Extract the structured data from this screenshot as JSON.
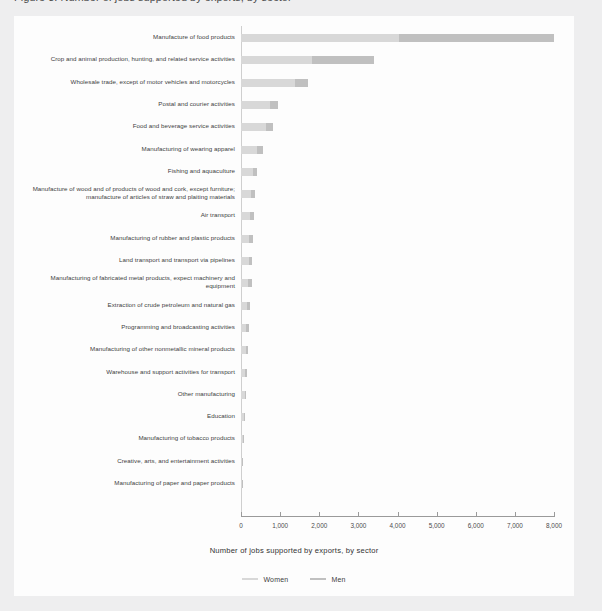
{
  "page": {
    "title_clipped": "Figure 3. Number of jobs supported by exports, by sector"
  },
  "chart_data": {
    "type": "bar",
    "orientation": "horizontal",
    "stacked": true,
    "title": "",
    "xlabel": "Number of jobs supported by exports, by sector",
    "ylabel": "",
    "xlim": [
      0,
      8000
    ],
    "xticks": [
      0,
      1000,
      2000,
      3000,
      4000,
      5000,
      6000,
      7000,
      8000
    ],
    "xticklabels": [
      "0",
      "1,000",
      "2,000",
      "3,000",
      "4,000",
      "5,000",
      "6,000",
      "7,000",
      "8,000"
    ],
    "grid": false,
    "legend_position": "bottom",
    "colors": {
      "women": "#d8d8d8",
      "men": "#c0c0c0"
    },
    "categories": [
      "Manufacture of food products",
      "Crop and animal production, hunting, and related service activities",
      "Wholesale trade, except of motor vehicles and motorcycles",
      "Postal and courier activities",
      "Food and beverage service activities",
      "Manufacturing of wearing apparel",
      "Fishing and aquaculture",
      "Manufacture of wood and of products of wood and cork, except furniture; manufacture of articles of straw and plaiting materials",
      "Air transport",
      "Manufacturing of rubber and plastic products",
      "Land transport and transport via pipelines",
      "Manufacturing of fabricated metal products, expect machinery and equipment",
      "Extraction of crude petroleum and natural gas",
      "Programming and broadcasting activities",
      "Manufacturing of other nonmetallic mineral products",
      "Warehouse and support activities for transport",
      "Other manufacturing",
      "Education",
      "Manufacturing of tobacco products",
      "Creative, arts, and entertainment activities",
      "Manufacturing of paper and paper products"
    ],
    "series": [
      {
        "name": "Women",
        "values": [
          4030,
          1820,
          1370,
          740,
          640,
          410,
          300,
          250,
          230,
          215,
          200,
          190,
          150,
          140,
          130,
          110,
          95,
          70,
          55,
          30,
          15
        ]
      },
      {
        "name": "Men",
        "values": [
          3970,
          1580,
          340,
          200,
          190,
          150,
          110,
          100,
          95,
          90,
          85,
          80,
          70,
          65,
          60,
          55,
          45,
          35,
          25,
          15,
          8
        ]
      }
    ]
  }
}
